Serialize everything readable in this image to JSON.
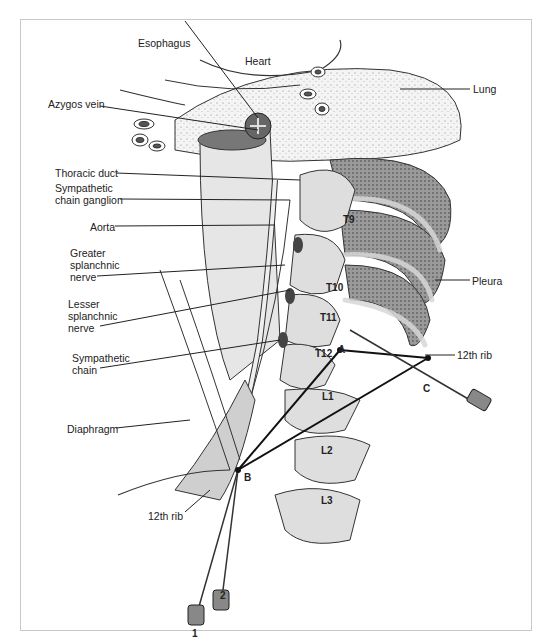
{
  "figure": {
    "labels": {
      "esophagus": "Esophagus",
      "heart": "Heart",
      "lung": "Lung",
      "azygos_vein": "Azygos vein",
      "thoracic_duct": "Thoracic duct",
      "sympathetic_chain_ganglion_1": "Sympathetic",
      "sympathetic_chain_ganglion_2": "chain ganglion",
      "aorta": "Aorta",
      "greater_splanchnic_1": "Greater",
      "greater_splanchnic_2": "splanchnic",
      "greater_splanchnic_3": "nerve",
      "lesser_splanchnic_1": "Lesser",
      "lesser_splanchnic_2": "splanchnic",
      "lesser_splanchnic_3": "nerve",
      "sympathetic_chain_1": "Sympathetic",
      "sympathetic_chain_2": "chain",
      "diaphragm": "Diaphragm",
      "pleura": "Pleura",
      "rib12_right": "12th rib",
      "rib12_left": "12th rib"
    },
    "vertebrae": [
      "T9",
      "T10",
      "T11",
      "T12",
      "L1",
      "L2",
      "L3"
    ],
    "points": {
      "a": "A",
      "b": "B",
      "c": "C"
    },
    "needles": {
      "n1": "1",
      "n2": "2"
    }
  }
}
